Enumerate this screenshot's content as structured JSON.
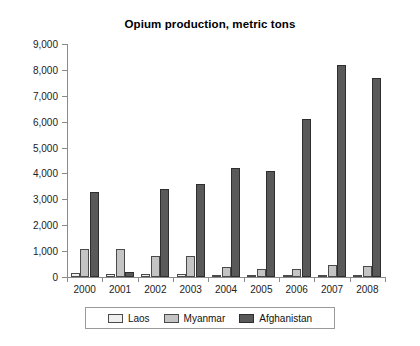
{
  "ghost_text": "",
  "chart_data": {
    "type": "bar",
    "title": "Opium production, metric tons",
    "xlabel": "",
    "ylabel": "",
    "ylim": [
      0,
      9000
    ],
    "ytick_values": [
      0,
      1000,
      2000,
      3000,
      4000,
      5000,
      6000,
      7000,
      8000,
      9000
    ],
    "ytick_labels": [
      "0",
      "1,000",
      "2,000",
      "3,000",
      "4,000",
      "5,000",
      "6,000",
      "7,000",
      "8,000",
      "9,000"
    ],
    "grid": false,
    "legend_position": "bottom",
    "categories": [
      "2000",
      "2001",
      "2002",
      "2003",
      "2004",
      "2005",
      "2006",
      "2007",
      "2008"
    ],
    "series": [
      {
        "name": "Laos",
        "color": "#efefef",
        "values": [
          167,
          134,
          112,
          120,
          43,
          14,
          20,
          9,
          10
        ]
      },
      {
        "name": "Myanmar",
        "color": "#c4c4c4",
        "values": [
          1087,
          1097,
          828,
          810,
          370,
          312,
          315,
          460,
          410
        ]
      },
      {
        "name": "Afghanistan",
        "color": "#595959",
        "values": [
          3276,
          185,
          3400,
          3600,
          4200,
          4100,
          6100,
          8200,
          7700
        ]
      }
    ]
  }
}
